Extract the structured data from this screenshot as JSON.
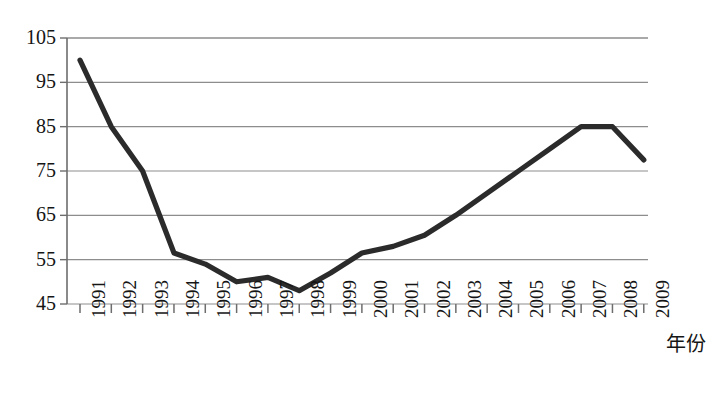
{
  "chart_data": {
    "type": "line",
    "title": "",
    "subtitle": "",
    "xlabel": "年份",
    "ylabel": "",
    "categories": [
      "1991",
      "1992",
      "1993",
      "1994",
      "1995",
      "1996",
      "1997",
      "1998",
      "1999",
      "2000",
      "2001",
      "2002",
      "2003",
      "2004",
      "2005",
      "2006",
      "2007",
      "2008",
      "2009"
    ],
    "values": [
      100,
      85,
      75,
      56.5,
      54,
      50,
      51,
      48,
      52,
      56.5,
      58,
      60.5,
      65,
      70,
      75,
      80,
      85,
      85,
      77.5
    ],
    "series": [
      {
        "name": "series-1",
        "values": [
          100,
          85,
          75,
          56.5,
          54,
          50,
          51,
          48,
          52,
          56.5,
          58,
          60.5,
          65,
          70,
          75,
          80,
          85,
          85,
          77.5
        ]
      }
    ],
    "ylim": [
      45,
      105
    ],
    "yticks": [
      45,
      55,
      65,
      75,
      85,
      95,
      105
    ],
    "ytick_labels": [
      "45",
      "55",
      "65",
      "75",
      "85",
      "95",
      "105"
    ],
    "grid": true,
    "grid_axis": "y",
    "legend": false,
    "legend_position": "none",
    "line_color": "#2b2b2b",
    "grid_color": "#8d8d8d",
    "axis_color": "#6d6d6d",
    "text_color": "#151515",
    "background": "#ffffff"
  },
  "axis": {
    "x_title": "年份"
  }
}
